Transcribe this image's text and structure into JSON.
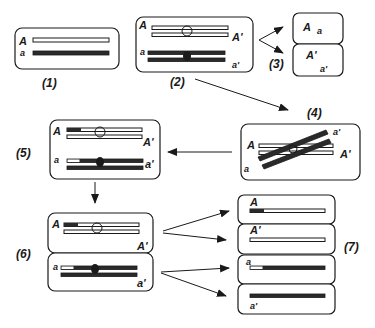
{
  "diagram": {
    "colors": {
      "ink": "#1a1a1a",
      "dark_strand": "#2a2a2a",
      "light_strand": "#ffffff",
      "background": "#ffffff"
    },
    "steps": [
      {
        "id": "1",
        "label": "(1)",
        "alleles": [
          "A",
          "a"
        ]
      },
      {
        "id": "2",
        "label": "(2)",
        "alleles": [
          "A",
          "A'",
          "a",
          "a'"
        ]
      },
      {
        "id": "3",
        "label": "(3)",
        "cells": [
          {
            "alleles": [
              "A",
              "a"
            ]
          },
          {
            "alleles": [
              "A'",
              "a'"
            ]
          }
        ]
      },
      {
        "id": "4",
        "label": "(4)",
        "alleles": [
          "A",
          "a'",
          "A'",
          "a"
        ]
      },
      {
        "id": "5",
        "label": "(5)",
        "alleles": [
          "A",
          "A'",
          "a",
          "a'"
        ]
      },
      {
        "id": "6",
        "label": "(6)",
        "cells": [
          {
            "alleles": [
              "A",
              "A'"
            ]
          },
          {
            "alleles": [
              "a",
              "a'"
            ]
          }
        ]
      },
      {
        "id": "7",
        "label": "(7)",
        "cells": [
          {
            "allele": "A"
          },
          {
            "allele": "A'"
          },
          {
            "allele": "a"
          },
          {
            "allele": "a'"
          }
        ]
      }
    ],
    "labels": {
      "A": "A",
      "a": "a",
      "Ap": "A'",
      "ap": "a'",
      "n1": "(1)",
      "n2": "(2)",
      "n3": "(3)",
      "n4": "(4)",
      "n5": "(5)",
      "n6": "(6)",
      "n7": "(7)"
    }
  }
}
